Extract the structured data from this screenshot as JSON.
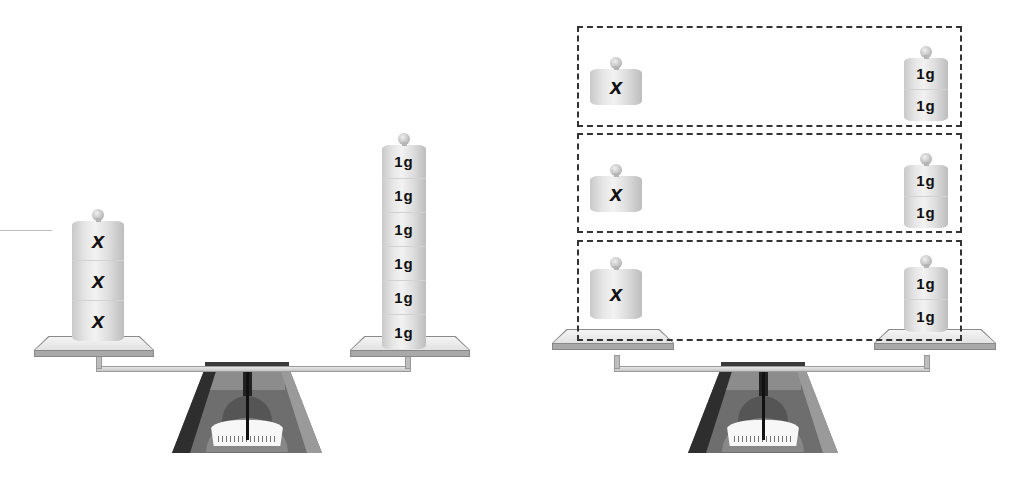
{
  "figure": {
    "left_panel": {
      "left_pan": {
        "weights": [
          "x",
          "x",
          "x"
        ]
      },
      "right_pan": {
        "weights": [
          "1g",
          "1g",
          "1g",
          "1g",
          "1g",
          "1g"
        ]
      }
    },
    "right_panel": {
      "groups": [
        {
          "left": [
            "x"
          ],
          "right": [
            "1g",
            "1g"
          ]
        },
        {
          "left": [
            "x"
          ],
          "right": [
            "1g",
            "1g"
          ]
        },
        {
          "left": [
            "x"
          ],
          "right": [
            "1g",
            "1g"
          ]
        }
      ]
    },
    "colors": {
      "background": "#ffffff",
      "dash": "#333333",
      "base_dark": "#2e2e2e",
      "base_mid": "#6e6e6e",
      "weight_light": "#e6e6e6",
      "label": "#111111"
    }
  }
}
